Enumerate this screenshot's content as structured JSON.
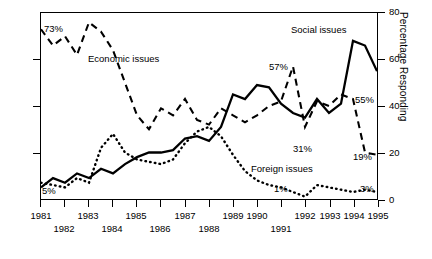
{
  "chart_data": {
    "type": "line",
    "title": "",
    "xlabel": "",
    "ylabel": "Percentage Responding",
    "ylim": [
      0,
      80
    ],
    "yticks": [
      0,
      20,
      40,
      60,
      80
    ],
    "xlim": [
      1981,
      1995
    ],
    "grid": false,
    "legend": "inline-labels",
    "x": [
      1981,
      1981.5,
      1982,
      1982.5,
      1983,
      1983.5,
      1984,
      1984.5,
      1985,
      1985.5,
      1986,
      1986.5,
      1987,
      1987.5,
      1988,
      1988.5,
      1989,
      1989.5,
      1990,
      1990.5,
      1991,
      1991.5,
      1992,
      1992.5,
      1993,
      1993.5,
      1994,
      1994.5,
      1995
    ],
    "series": [
      {
        "name": "Economic issues",
        "style": "dashed",
        "values": [
          73,
          66,
          70,
          62,
          76,
          72,
          64,
          50,
          36,
          30,
          39,
          36,
          43,
          34,
          32,
          39,
          36,
          33,
          36,
          40,
          42,
          57,
          31,
          42,
          40,
          45,
          43,
          20,
          19
        ]
      },
      {
        "name": "Social issues",
        "style": "solid",
        "values": [
          5,
          9,
          7,
          11,
          9,
          13,
          11,
          15,
          18,
          20,
          20,
          21,
          26,
          27,
          25,
          31,
          45,
          43,
          49,
          48,
          41,
          37,
          35,
          43,
          37,
          41,
          68,
          66,
          55
        ]
      },
      {
        "name": "Foreign issues",
        "style": "dotted",
        "values": [
          7,
          6,
          5,
          9,
          7,
          22,
          28,
          20,
          17,
          16,
          15,
          17,
          24,
          29,
          31,
          27,
          19,
          12,
          8,
          6,
          5,
          3,
          1,
          6,
          5,
          4,
          3,
          4,
          3
        ]
      }
    ],
    "annotations": [
      {
        "label": "73%",
        "series": "Economic issues",
        "x": 1981,
        "y": 73
      },
      {
        "label": "5%",
        "series": "Social issues",
        "x": 1981,
        "y": 5
      },
      {
        "label": "57%",
        "series": "Economic issues",
        "x": 1991.5,
        "y": 57
      },
      {
        "label": "31%",
        "series": "Economic issues",
        "x": 1992,
        "y": 31
      },
      {
        "label": "55%",
        "series": "Social issues",
        "x": 1995,
        "y": 55
      },
      {
        "label": "19%",
        "series": "Economic issues",
        "x": 1995,
        "y": 19
      },
      {
        "label": "1%",
        "series": "Foreign issues",
        "x": 1992,
        "y": 1
      },
      {
        "label": "3%",
        "series": "Foreign issues",
        "x": 1995,
        "y": 3
      }
    ],
    "series_labels": [
      {
        "text": "Economic issues",
        "x": 1983.1,
        "y": 63
      },
      {
        "text": "Social issues",
        "x": 1992.3,
        "y": 74
      },
      {
        "text": "Foreign issues",
        "x": 1990.6,
        "y": 12
      }
    ],
    "xtick_labels_upper": [
      "1981",
      "1983",
      "1985",
      "1987",
      "1989",
      "1990",
      "1992",
      "1993",
      "1994",
      "1995"
    ],
    "xtick_labels_lower": [
      "1982",
      "1984",
      "1986",
      "1988",
      "1991"
    ]
  },
  "axes": {
    "y_right_title": "Percentage Responding",
    "y_right_ticks": [
      "0",
      "20",
      "40",
      "60",
      "80"
    ]
  },
  "labels": {
    "economic": "Economic issues",
    "social": "Social issues",
    "foreign": "Foreign issues",
    "v73": "73%",
    "v5": "5%",
    "v57": "57%",
    "v31": "31%",
    "v55": "55%",
    "v19": "19%",
    "v1": "1%",
    "v3": "3%"
  },
  "xaxis": {
    "upper": [
      "1981",
      "1983",
      "1985",
      "1987",
      "1989",
      "1990",
      "1992",
      "1993",
      "1994",
      "1995"
    ],
    "lower": [
      "1982",
      "1984",
      "1986",
      "1988",
      "1991"
    ]
  },
  "colors": {
    "ink": "#000000",
    "background": "#ffffff"
  }
}
